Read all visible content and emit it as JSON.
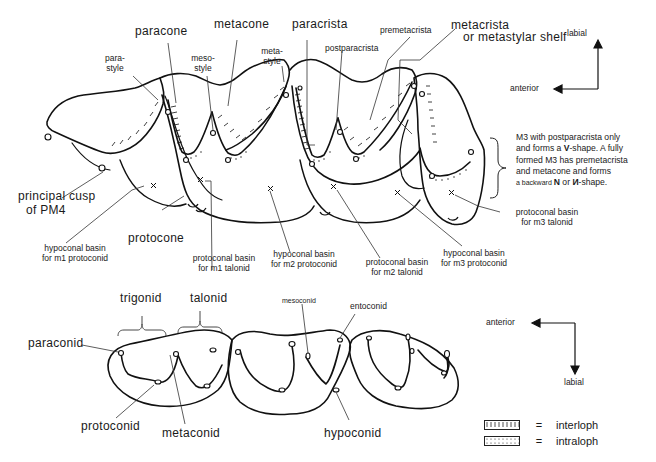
{
  "upper_dentition": {
    "labels": {
      "paracone": "paracone",
      "metacone": "metacone",
      "paracrista": "paracrista",
      "premetacrista": "premetacrista",
      "metacrista_line1": "metacrista",
      "metacrista_line2": "or metastylar shelf",
      "parastyle_line1": "para-",
      "parastyle_line2": "style",
      "mesostyle_line1": "meso-",
      "mesostyle_line2": "style",
      "metastyle_line1": "meta-",
      "metastyle_line2": "style",
      "postparacrista": "postparacrista",
      "principal_cusp_line1": "principal  cusp",
      "principal_cusp_line2": "of PM4",
      "protocone": "protocone",
      "hypoconal_m1_line1": "hypoconal basin",
      "hypoconal_m1_line2": "for m1 protoconid",
      "protoconal_m1_line1": "protoconal basin",
      "protoconal_m1_line2": "for m1 talonid",
      "hypoconal_m2_line1": "hypoconal basin",
      "hypoconal_m2_line2": "for m2 protoconid",
      "protoconal_m2_line1": "protoconal basin",
      "protoconal_m2_line2": "for m2 talonid",
      "hypoconal_m3_line1": "hypoconal basin",
      "hypoconal_m3_line2": "for m3 protoconid",
      "protoconal_m3_line1": "protoconal basin",
      "protoconal_m3_line2": "for m3 talonid"
    },
    "orientation": {
      "anterior": "anterior",
      "labial": "labial"
    },
    "m3_note": {
      "line1": "M3 with postparacrista only",
      "line2_pre": "and forms a ",
      "line2_bold": "V",
      "line2_post": "-shape. A fully",
      "line3": "formed M3 has premetacrista",
      "line4": "and metacone and forms",
      "line5_small": "a backward ",
      "line5_bold1": "N",
      "line5_mid": " or ",
      "line5_bold2": "И",
      "line5_post": "-shape."
    }
  },
  "lower_dentition": {
    "labels": {
      "trigonid": "trigonid",
      "talonid": "talonid",
      "mesoconid": "mesoconid",
      "entoconid": "entoconid",
      "paraconid": "paraconid",
      "protoconid": "protoconid",
      "metaconid": "metaconid",
      "hypoconid": "hypoconid"
    },
    "orientation": {
      "anterior": "anterior",
      "labial": "labial"
    }
  },
  "legend": {
    "items": [
      {
        "symbol": "hatched-bar",
        "eq": "=",
        "label": "interloph"
      },
      {
        "symbol": "dotted-bar",
        "eq": "=",
        "label": "intraloph"
      }
    ]
  },
  "colors": {
    "ink": "#1a1a1a",
    "background": "#ffffff"
  }
}
